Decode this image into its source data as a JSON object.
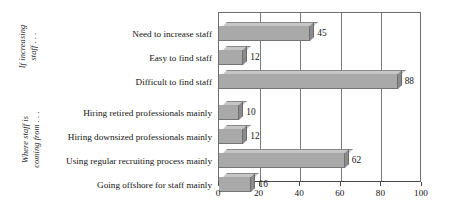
{
  "chart_data": {
    "type": "bar",
    "orientation": "horizontal",
    "title": "",
    "subtitle": "",
    "xlabel": "",
    "ylabel": "",
    "xlim": [
      0,
      100
    ],
    "xticks": [
      0,
      20,
      40,
      60,
      80,
      100
    ],
    "xtick_labels": [
      "0",
      "20",
      "40",
      "60",
      "80",
      "100"
    ],
    "grid": true,
    "grid_axis": "x",
    "legend": false,
    "legend_position": "none",
    "style": "3d-bar-grayscale",
    "categories": [
      "Need to increase staff",
      "Easy to find staff",
      "Difficult to find staff",
      "Hiring retired professionals mainly",
      "Hiring downsized professionals mainly",
      "Using regular recruiting process mainly",
      "Going offshore for staff mainly"
    ],
    "values": [
      45,
      12,
      88,
      10,
      12,
      62,
      16
    ],
    "value_labels": [
      "45",
      "12",
      "88",
      "10",
      "12",
      "62",
      "16"
    ],
    "groups": [
      {
        "label_lines": [
          "If increasing",
          "staff . . ."
        ],
        "categories": [
          "Need to increase staff",
          "Easy to find staff",
          "Difficult to find staff"
        ],
        "values": [
          45,
          12,
          88
        ]
      },
      {
        "label_lines": [
          "Where staff is",
          "coming from . . ."
        ],
        "categories": [
          "Hiring retired professionals mainly",
          "Hiring downsized professionals mainly",
          "Using regular recruiting process mainly",
          "Going offshore for staff mainly"
        ],
        "values": [
          10,
          12,
          62,
          16
        ]
      }
    ],
    "colors": {
      "bar_face": "#a9a9a9",
      "bar_top": "#c6c6c6",
      "bar_side": "#8b8b8b",
      "bar_outline": "#6f6f6f",
      "gridline": "#7a7a7a",
      "axis": "#4a4a4a",
      "plot_border": "#6e6e6e",
      "text": "#141414",
      "background": "#ffffff"
    }
  }
}
